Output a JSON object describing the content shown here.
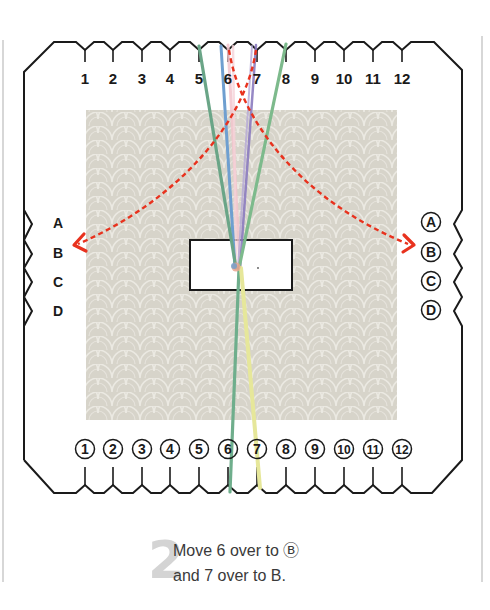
{
  "diagram": {
    "type": "kumihimo-square-disk-instruction",
    "top_slot_labels": [
      "1",
      "2",
      "3",
      "4",
      "5",
      "6",
      "7",
      "8",
      "9",
      "10",
      "11",
      "12"
    ],
    "bottom_slot_labels": [
      "①",
      "②",
      "③",
      "④",
      "⑤",
      "⑥",
      "⑦",
      "⑧",
      "⑨",
      "⑩",
      "⑪",
      "⑫"
    ],
    "left_slot_labels": [
      "A",
      "B",
      "C",
      "D"
    ],
    "right_slot_labels": [
      "Ⓐ",
      "Ⓑ",
      "Ⓒ",
      "Ⓓ"
    ],
    "arrows": [
      {
        "from": "6",
        "to": "Ⓑ",
        "color": "#e8321e",
        "style": "dashed"
      },
      {
        "from": "7",
        "to": "B",
        "color": "#e8321e",
        "style": "dashed"
      }
    ],
    "threads": [
      {
        "name": "green-thread-5",
        "color": "#6aa587"
      },
      {
        "name": "pink-thread-6",
        "color": "#f2c4cc"
      },
      {
        "name": "purple-thread-7",
        "color": "#8b7bbf"
      },
      {
        "name": "green-thread-8",
        "color": "#7dba8c"
      },
      {
        "name": "blue-thread",
        "color": "#6f9fd0"
      },
      {
        "name": "yellow-thread",
        "color": "#e6e79a"
      }
    ],
    "colors": {
      "outline": "#1a1a1a",
      "pattern_bg": "#d7d4ca",
      "arrow": "#e8321e",
      "step_number": "#d4d4d4"
    }
  },
  "caption": {
    "step_number": "2",
    "line1": "Move 6 over to Ⓑ",
    "line2": "and 7 over to B."
  }
}
